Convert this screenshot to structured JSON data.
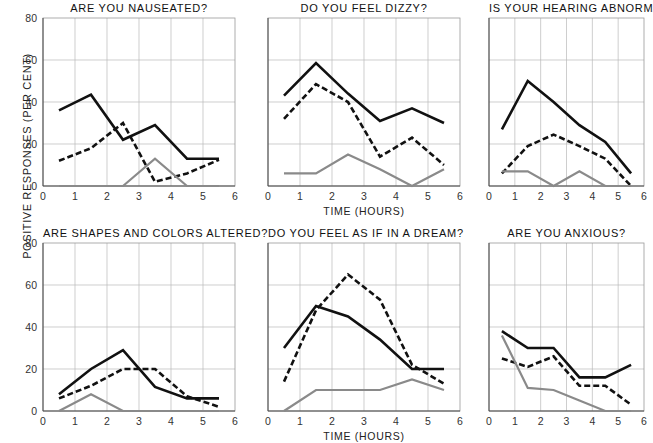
{
  "figure": {
    "ylabel": "POSITIVE RESPONSES (PER CENT)",
    "xlabel": "TIME (HOURS)"
  },
  "axes": {
    "xticks": [
      "0",
      "1",
      "2",
      "3",
      "4",
      "5",
      "6"
    ],
    "xvalues": [
      0,
      1,
      2,
      3,
      4,
      5,
      6
    ],
    "yticks_full": [
      "0",
      "20",
      "40",
      "60",
      "80"
    ],
    "yvalues_full": [
      0,
      20,
      40,
      60,
      80
    ],
    "xlim": [
      0,
      6
    ],
    "ylim": [
      0,
      80
    ],
    "grid": true
  },
  "series_styles": {
    "solid_black": {
      "color": "#111111",
      "dash": "none",
      "width": 2.6
    },
    "dashed_black": {
      "color": "#111111",
      "dash": "6,3",
      "width": 2.6
    },
    "solid_gray": {
      "color": "#8a8a8a",
      "dash": "none",
      "width": 2.2
    }
  },
  "chart_data": [
    {
      "id": "nauseated",
      "type": "line",
      "title": "ARE YOU NAUSEATED?",
      "xlabel": "",
      "ylabel": "",
      "xlim": [
        0,
        6
      ],
      "ylim": [
        0,
        80
      ],
      "x": [
        0.5,
        1.5,
        2.5,
        3.5,
        4.5,
        5.5
      ],
      "series": [
        {
          "name": "solid_black",
          "values": [
            36,
            43.5,
            22,
            29,
            13,
            13
          ]
        },
        {
          "name": "dashed_black",
          "values": [
            12,
            18,
            30,
            2,
            6,
            12.5
          ]
        },
        {
          "name": "solid_gray",
          "values": [
            0,
            0,
            0,
            13,
            0,
            0
          ]
        }
      ]
    },
    {
      "id": "dizzy",
      "type": "line",
      "title": "DO YOU FEEL DIZZY?",
      "xlabel": "TIME (HOURS)",
      "ylabel": "",
      "xlim": [
        0,
        6
      ],
      "ylim": [
        0,
        80
      ],
      "x": [
        0.5,
        1.5,
        2.5,
        3.5,
        4.5,
        5.5
      ],
      "series": [
        {
          "name": "solid_black",
          "values": [
            43,
            58.5,
            44,
            31,
            37,
            30
          ]
        },
        {
          "name": "dashed_black",
          "values": [
            32,
            48.5,
            40,
            14,
            23,
            10
          ]
        },
        {
          "name": "solid_gray",
          "values": [
            6,
            6,
            15,
            8,
            0,
            8
          ]
        }
      ]
    },
    {
      "id": "hearing",
      "type": "line",
      "title": "IS YOUR HEARING ABNORMAL?",
      "xlabel": "",
      "ylabel": "",
      "xlim": [
        0,
        6
      ],
      "ylim": [
        0,
        80
      ],
      "x": [
        0.5,
        1.5,
        2.5,
        3.5,
        4.5,
        5.5
      ],
      "series": [
        {
          "name": "solid_black",
          "values": [
            27,
            50,
            40,
            29,
            21,
            6
          ]
        },
        {
          "name": "dashed_black",
          "values": [
            6,
            19,
            24.5,
            19,
            13,
            0
          ]
        },
        {
          "name": "solid_gray",
          "values": [
            7,
            7,
            0,
            7,
            0,
            0
          ]
        }
      ]
    },
    {
      "id": "shapes_colors",
      "type": "line",
      "title": "ARE SHAPES AND COLORS ALTERED?",
      "xlabel": "",
      "ylabel": "",
      "xlim": [
        0,
        6
      ],
      "ylim": [
        0,
        80
      ],
      "x": [
        0.5,
        1.5,
        2.5,
        3.5,
        4.5,
        5.5
      ],
      "series": [
        {
          "name": "solid_black",
          "values": [
            8,
            20,
            29,
            11.5,
            6,
            6
          ]
        },
        {
          "name": "dashed_black",
          "values": [
            6,
            12,
            20,
            20,
            7,
            2
          ]
        },
        {
          "name": "solid_gray",
          "values": [
            0,
            8,
            0,
            0,
            0,
            0
          ]
        }
      ]
    },
    {
      "id": "dream",
      "type": "line",
      "title": "DO YOU FEEL AS IF IN A DREAM?",
      "xlabel": "TIME (HOURS)",
      "ylabel": "",
      "xlim": [
        0,
        6
      ],
      "ylim": [
        0,
        80
      ],
      "x": [
        0.5,
        1.5,
        2.5,
        3.5,
        4.5,
        5.5
      ],
      "series": [
        {
          "name": "solid_black",
          "values": [
            30,
            50,
            45,
            34,
            20,
            20
          ]
        },
        {
          "name": "dashed_black",
          "values": [
            14,
            48,
            65,
            53,
            22,
            13
          ]
        },
        {
          "name": "solid_gray",
          "values": [
            0,
            10,
            10,
            10,
            15,
            10
          ]
        }
      ]
    },
    {
      "id": "anxious",
      "type": "line",
      "title": "ARE YOU ANXIOUS?",
      "xlabel": "",
      "ylabel": "",
      "xlim": [
        0,
        6
      ],
      "ylim": [
        0,
        80
      ],
      "x": [
        0.5,
        1.5,
        2.5,
        3.5,
        4.5,
        5.5
      ],
      "series": [
        {
          "name": "solid_black",
          "values": [
            38,
            30,
            30,
            16,
            16,
            22
          ]
        },
        {
          "name": "dashed_black",
          "values": [
            25,
            21,
            26,
            12,
            12,
            3
          ]
        },
        {
          "name": "solid_gray",
          "values": [
            36,
            11,
            10,
            5,
            0,
            0
          ]
        }
      ]
    }
  ]
}
